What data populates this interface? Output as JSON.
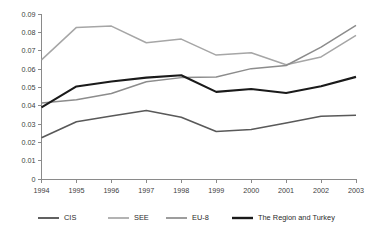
{
  "chart_data": {
    "type": "line",
    "title": "",
    "subtitle": "",
    "xlabel": "",
    "ylabel": "",
    "categories": [
      "1994",
      "1995",
      "1996",
      "1997",
      "1998",
      "1999",
      "2000",
      "2001",
      "2002",
      "2003"
    ],
    "x_tick_labels": [
      "1994",
      "1995",
      "1996",
      "1997",
      "1998",
      "1999",
      "2000",
      "2001",
      "2002",
      "2003"
    ],
    "y_tick_labels": [
      "0",
      "0.01",
      "0.02",
      "0.03",
      "0.04",
      "0.05",
      "0.06",
      "0.07",
      "0.08",
      "0.09"
    ],
    "y_tick_values": [
      0,
      0.01,
      0.02,
      0.03,
      0.04,
      0.05,
      0.06,
      0.07,
      0.08,
      0.09
    ],
    "ylim": [
      0,
      0.09
    ],
    "grid": false,
    "legend_position": "bottom",
    "series": [
      {
        "name": "CIS",
        "color": "#595959",
        "width": 1.6,
        "values": [
          0.0225,
          0.0312,
          0.0344,
          0.0374,
          0.0337,
          0.0259,
          0.027,
          0.0305,
          0.0342,
          0.0348
        ]
      },
      {
        "name": "SEE",
        "color": "#a6a6a6",
        "width": 1.5,
        "values": [
          0.065,
          0.0827,
          0.0834,
          0.0743,
          0.0763,
          0.0676,
          0.0689,
          0.0623,
          0.0666,
          0.0784
        ]
      },
      {
        "name": "EU-8",
        "color": "#8c8c8c",
        "width": 1.5,
        "values": [
          0.0415,
          0.0432,
          0.0466,
          0.053,
          0.0553,
          0.0556,
          0.0602,
          0.0619,
          0.0719,
          0.0838
        ]
      },
      {
        "name": "The Region and Turkey",
        "color": "#1a1a1a",
        "width": 2.1,
        "values": [
          0.0391,
          0.0505,
          0.0532,
          0.0553,
          0.0566,
          0.0475,
          0.0491,
          0.0469,
          0.0506,
          0.0557
        ]
      }
    ],
    "legend": [
      {
        "label": "CIS",
        "color": "#595959",
        "width": 1.9
      },
      {
        "label": "SEE",
        "color": "#a6a6a6",
        "width": 1.7
      },
      {
        "label": "EU-8",
        "color": "#8c8c8c",
        "width": 1.7
      },
      {
        "label": "The Region and Turkey",
        "color": "#1a1a1a",
        "width": 2.4
      }
    ]
  },
  "axes": {
    "axis_color": "#8a8a8a",
    "tick_text_color": "#404040"
  }
}
